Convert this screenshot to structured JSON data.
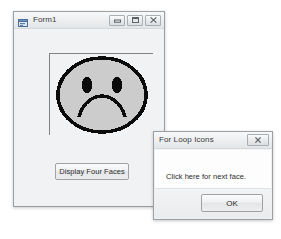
{
  "main_window": {
    "title": "Form1",
    "icon": "form-designer-icon",
    "titlebar_buttons": [
      {
        "name": "minimize",
        "glyph": "minimize-icon"
      },
      {
        "name": "maximize",
        "glyph": "maximize-icon"
      },
      {
        "name": "close",
        "glyph": "close-icon"
      }
    ],
    "picture_box": {
      "name": "face-picture-box",
      "content": "sad-face",
      "description": "Pixelated sad face with two oval eyes and a frowning mouth",
      "fill_color": "#cccccc",
      "outline_color": "#000000"
    },
    "button": {
      "label": "Display Four Faces"
    }
  },
  "dialog": {
    "title": "For Loop Icons",
    "titlebar_buttons": [
      {
        "name": "close",
        "glyph": "close-icon"
      }
    ],
    "message": "Click here for next face.",
    "ok_label": "OK"
  }
}
